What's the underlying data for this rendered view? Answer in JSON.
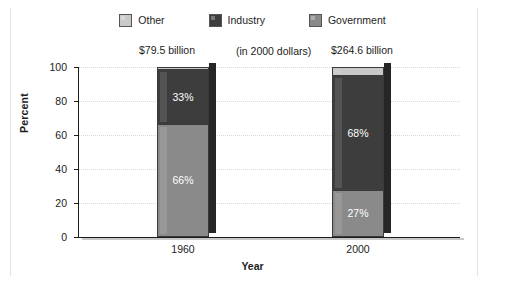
{
  "chart_data": {
    "type": "bar",
    "stacked": true,
    "percent": true,
    "title": "",
    "xlabel": "Year",
    "ylabel": "Percent",
    "ylim": [
      0,
      100
    ],
    "ytick_labels": [
      "0",
      "20",
      "40",
      "60",
      "80",
      "100"
    ],
    "ytick_values": [
      0,
      20,
      40,
      60,
      80,
      100
    ],
    "grid": true,
    "legend_position": "top-center",
    "categories": [
      "1960",
      "2000"
    ],
    "series": [
      {
        "name": "Government",
        "color": "#8a8a8a",
        "values": [
          66,
          27
        ],
        "labels": [
          "66%",
          "27%"
        ]
      },
      {
        "name": "Industry",
        "color": "#3d3d3d",
        "values": [
          33,
          68
        ],
        "labels": [
          "33%",
          "68%"
        ]
      },
      {
        "name": "Other",
        "color": "#c9c9c9",
        "values": [
          1,
          5
        ],
        "labels": [
          "",
          ""
        ]
      }
    ],
    "annotations": [
      {
        "text": "$79.5 billion"
      },
      {
        "text": "(in 2000 dollars)"
      },
      {
        "text": "$264.6 billion"
      }
    ]
  },
  "legend": {
    "items": [
      {
        "label": "Other",
        "color": "#c9c9c9"
      },
      {
        "label": "Industry",
        "color": "#3d3d3d"
      },
      {
        "label": "Government",
        "color": "#8a8a8a"
      }
    ]
  }
}
